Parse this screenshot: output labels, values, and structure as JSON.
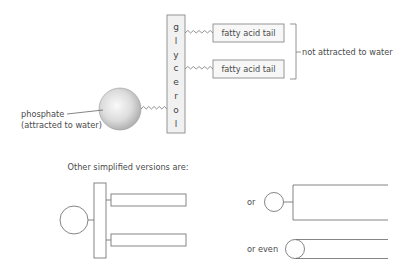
{
  "diagram": {
    "main": {
      "glycerol_letters": [
        "g",
        "l",
        "y",
        "c",
        "e",
        "r",
        "o",
        "l"
      ],
      "tails": [
        {
          "label": "fatty acid tail"
        },
        {
          "label": "fatty acid tail"
        }
      ],
      "bracket_label": "not attracted to water",
      "phosphate_label_line1": "phosphate",
      "phosphate_label_line2": "(attracted to water)"
    },
    "simplified": {
      "heading": "Other simplified versions are:",
      "alt1_label": "or",
      "alt2_label": "or even"
    },
    "colors": {
      "sphere_light": "#f2f2f2",
      "sphere_dark": "#a8a8a8",
      "stroke": "#7a7a7a",
      "text": "#4a4a4a"
    }
  }
}
